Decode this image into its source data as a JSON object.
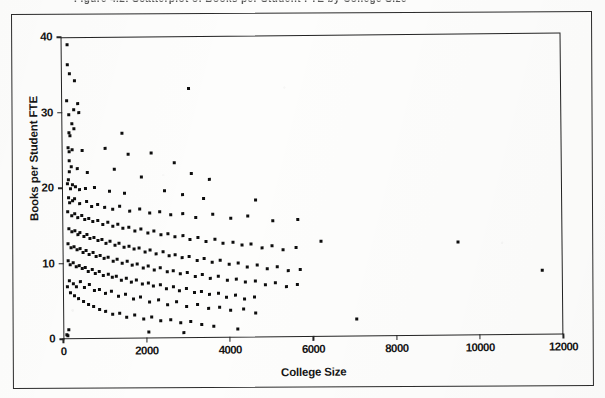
{
  "figure": {
    "caption": "Figure 4.2:  Scatterplot of Books per Student FTE by College Size"
  },
  "chart_data": {
    "type": "scatter",
    "title": "",
    "xlabel": "College Size",
    "ylabel": "Books per Student FTE",
    "xlim": [
      0,
      12000
    ],
    "ylim": [
      0,
      40
    ],
    "xticks": [
      0,
      2000,
      4000,
      6000,
      8000,
      10000,
      12000
    ],
    "yticks": [
      0,
      10,
      20,
      30,
      40
    ],
    "xtick_labels": [
      "0",
      "2000",
      "4000",
      "6000",
      "8000",
      "10000",
      "12000"
    ],
    "ytick_labels": [
      "0",
      "10",
      "20",
      "30",
      "40"
    ],
    "grid": false,
    "legend": null,
    "marker": "square",
    "marker_color": "#0d0d0d",
    "marker_size_px": 3,
    "n_points": 268,
    "points": [
      [
        150,
        36.3
      ],
      [
        210,
        35.1
      ],
      [
        330,
        34.2
      ],
      [
        120,
        31.6
      ],
      [
        390,
        31.2
      ],
      [
        300,
        30.4
      ],
      [
        420,
        30.0
      ],
      [
        180,
        29.7
      ],
      [
        250,
        28.6
      ],
      [
        300,
        27.9
      ],
      [
        170,
        27.3
      ],
      [
        210,
        26.9
      ],
      [
        1450,
        27.2
      ],
      [
        3050,
        33.0
      ],
      [
        160,
        25.4
      ],
      [
        260,
        25.1
      ],
      [
        170,
        24.8
      ],
      [
        480,
        25.0
      ],
      [
        1050,
        25.2
      ],
      [
        1600,
        24.4
      ],
      [
        2150,
        24.6
      ],
      [
        2700,
        23.2
      ],
      [
        170,
        23.6
      ],
      [
        230,
        22.9
      ],
      [
        190,
        22.2
      ],
      [
        380,
        22.6
      ],
      [
        620,
        22.1
      ],
      [
        1250,
        22.4
      ],
      [
        1900,
        21.4
      ],
      [
        3100,
        21.8
      ],
      [
        3550,
        21.0
      ],
      [
        160,
        21.1
      ],
      [
        120,
        20.6
      ],
      [
        260,
        20.4
      ],
      [
        330,
        20.2
      ],
      [
        200,
        20.0
      ],
      [
        420,
        19.8
      ],
      [
        560,
        19.9
      ],
      [
        780,
        20.1
      ],
      [
        1150,
        19.6
      ],
      [
        1500,
        19.3
      ],
      [
        2450,
        19.5
      ],
      [
        2900,
        19.0
      ],
      [
        3400,
        18.5
      ],
      [
        4650,
        18.2
      ],
      [
        150,
        18.8
      ],
      [
        240,
        18.4
      ],
      [
        190,
        18.1
      ],
      [
        310,
        18.6
      ],
      [
        430,
        17.9
      ],
      [
        580,
        18.2
      ],
      [
        700,
        17.6
      ],
      [
        860,
        17.8
      ],
      [
        1020,
        17.4
      ],
      [
        1200,
        17.1
      ],
      [
        1380,
        17.5
      ],
      [
        1620,
        16.9
      ],
      [
        1850,
        17.2
      ],
      [
        2100,
        16.6
      ],
      [
        2350,
        16.8
      ],
      [
        2600,
        16.3
      ],
      [
        2880,
        16.5
      ],
      [
        3200,
        16.0
      ],
      [
        3600,
        16.4
      ],
      [
        4050,
        15.8
      ],
      [
        4450,
        16.1
      ],
      [
        5050,
        15.4
      ],
      [
        5650,
        15.6
      ],
      [
        140,
        16.9
      ],
      [
        230,
        16.4
      ],
      [
        300,
        16.6
      ],
      [
        380,
        16.1
      ],
      [
        460,
        16.3
      ],
      [
        540,
        15.8
      ],
      [
        640,
        16.0
      ],
      [
        740,
        15.5
      ],
      [
        850,
        15.7
      ],
      [
        960,
        15.2
      ],
      [
        1080,
        15.4
      ],
      [
        1200,
        14.9
      ],
      [
        1330,
        15.1
      ],
      [
        1460,
        14.6
      ],
      [
        1600,
        14.8
      ],
      [
        1740,
        14.3
      ],
      [
        1890,
        14.5
      ],
      [
        2040,
        14.0
      ],
      [
        2200,
        14.2
      ],
      [
        2360,
        13.7
      ],
      [
        2530,
        13.9
      ],
      [
        2700,
        13.4
      ],
      [
        2880,
        13.6
      ],
      [
        3060,
        13.1
      ],
      [
        3250,
        13.3
      ],
      [
        3450,
        12.8
      ],
      [
        3650,
        13.0
      ],
      [
        3860,
        12.5
      ],
      [
        4080,
        12.7
      ],
      [
        4300,
        12.2
      ],
      [
        4530,
        12.4
      ],
      [
        4780,
        11.9
      ],
      [
        5030,
        12.1
      ],
      [
        5300,
        11.6
      ],
      [
        5600,
        11.8
      ],
      [
        6200,
        12.6
      ],
      [
        9500,
        12.4
      ],
      [
        150,
        14.7
      ],
      [
        220,
        14.2
      ],
      [
        290,
        14.4
      ],
      [
        360,
        13.9
      ],
      [
        430,
        14.1
      ],
      [
        510,
        13.6
      ],
      [
        590,
        13.8
      ],
      [
        670,
        13.3
      ],
      [
        760,
        13.5
      ],
      [
        850,
        13.0
      ],
      [
        940,
        13.2
      ],
      [
        1040,
        12.7
      ],
      [
        1140,
        12.9
      ],
      [
        1250,
        12.4
      ],
      [
        1360,
        12.6
      ],
      [
        1470,
        12.1
      ],
      [
        1590,
        12.3
      ],
      [
        1710,
        11.8
      ],
      [
        1840,
        12.0
      ],
      [
        1970,
        11.5
      ],
      [
        2110,
        11.7
      ],
      [
        2250,
        11.2
      ],
      [
        2400,
        11.4
      ],
      [
        2550,
        10.9
      ],
      [
        2710,
        11.1
      ],
      [
        2870,
        10.6
      ],
      [
        3040,
        10.8
      ],
      [
        3220,
        10.3
      ],
      [
        3400,
        10.5
      ],
      [
        3590,
        10.0
      ],
      [
        3790,
        10.2
      ],
      [
        4000,
        9.7
      ],
      [
        4210,
        9.9
      ],
      [
        4430,
        9.4
      ],
      [
        4660,
        9.6
      ],
      [
        4900,
        9.1
      ],
      [
        5150,
        9.3
      ],
      [
        5420,
        8.8
      ],
      [
        5700,
        9.0
      ],
      [
        11500,
        8.6
      ],
      [
        140,
        12.6
      ],
      [
        200,
        12.1
      ],
      [
        270,
        12.3
      ],
      [
        340,
        11.8
      ],
      [
        410,
        12.0
      ],
      [
        480,
        11.5
      ],
      [
        560,
        11.7
      ],
      [
        640,
        11.2
      ],
      [
        720,
        11.4
      ],
      [
        810,
        10.9
      ],
      [
        900,
        11.1
      ],
      [
        1000,
        10.6
      ],
      [
        1100,
        10.8
      ],
      [
        1200,
        10.3
      ],
      [
        1310,
        10.5
      ],
      [
        1420,
        10.0
      ],
      [
        1540,
        10.2
      ],
      [
        1660,
        9.7
      ],
      [
        1790,
        9.9
      ],
      [
        1920,
        9.4
      ],
      [
        2060,
        9.6
      ],
      [
        2200,
        9.1
      ],
      [
        2350,
        9.3
      ],
      [
        2500,
        8.8
      ],
      [
        2660,
        9.0
      ],
      [
        2820,
        8.5
      ],
      [
        2990,
        8.7
      ],
      [
        3170,
        8.2
      ],
      [
        3350,
        8.4
      ],
      [
        3540,
        7.9
      ],
      [
        3740,
        8.1
      ],
      [
        3950,
        7.6
      ],
      [
        4160,
        7.8
      ],
      [
        4380,
        7.3
      ],
      [
        4610,
        7.5
      ],
      [
        4850,
        7.0
      ],
      [
        5100,
        7.2
      ],
      [
        5360,
        6.7
      ],
      [
        5630,
        6.9
      ],
      [
        130,
        10.4
      ],
      [
        190,
        9.9
      ],
      [
        250,
        10.1
      ],
      [
        320,
        9.6
      ],
      [
        390,
        9.8
      ],
      [
        460,
        9.3
      ],
      [
        540,
        9.5
      ],
      [
        620,
        9.0
      ],
      [
        700,
        9.2
      ],
      [
        790,
        8.7
      ],
      [
        880,
        8.9
      ],
      [
        980,
        8.4
      ],
      [
        1080,
        8.6
      ],
      [
        1180,
        8.1
      ],
      [
        1290,
        8.3
      ],
      [
        1400,
        7.8
      ],
      [
        1520,
        8.0
      ],
      [
        1640,
        7.5
      ],
      [
        1770,
        7.7
      ],
      [
        1900,
        7.2
      ],
      [
        2040,
        7.4
      ],
      [
        2180,
        6.9
      ],
      [
        2330,
        7.1
      ],
      [
        2480,
        6.6
      ],
      [
        2640,
        6.8
      ],
      [
        2800,
        6.3
      ],
      [
        2970,
        6.5
      ],
      [
        3150,
        6.0
      ],
      [
        3330,
        6.2
      ],
      [
        3520,
        5.7
      ],
      [
        3720,
        5.9
      ],
      [
        3930,
        5.4
      ],
      [
        4140,
        5.6
      ],
      [
        4360,
        5.1
      ],
      [
        4590,
        5.3
      ],
      [
        160,
        7.8
      ],
      [
        240,
        7.4
      ],
      [
        330,
        7.0
      ],
      [
        420,
        7.6
      ],
      [
        520,
        6.8
      ],
      [
        630,
        7.2
      ],
      [
        750,
        6.4
      ],
      [
        880,
        6.6
      ],
      [
        1020,
        6.0
      ],
      [
        1170,
        6.3
      ],
      [
        1330,
        5.6
      ],
      [
        1500,
        5.9
      ],
      [
        1680,
        5.2
      ],
      [
        1870,
        5.5
      ],
      [
        2070,
        4.9
      ],
      [
        2280,
        5.1
      ],
      [
        2500,
        4.5
      ],
      [
        2730,
        4.8
      ],
      [
        2970,
        4.2
      ],
      [
        3220,
        4.4
      ],
      [
        3480,
        3.9
      ],
      [
        3750,
        4.1
      ],
      [
        4030,
        3.6
      ],
      [
        4320,
        3.8
      ],
      [
        4620,
        3.3
      ],
      [
        110,
        6.9
      ],
      [
        180,
        6.2
      ],
      [
        270,
        5.8
      ],
      [
        370,
        5.4
      ],
      [
        480,
        5.0
      ],
      [
        600,
        4.6
      ],
      [
        730,
        4.3
      ],
      [
        870,
        3.9
      ],
      [
        1020,
        3.6
      ],
      [
        1180,
        3.2
      ],
      [
        1350,
        3.4
      ],
      [
        1530,
        2.9
      ],
      [
        1720,
        3.1
      ],
      [
        1920,
        2.6
      ],
      [
        2130,
        2.8
      ],
      [
        2350,
        2.3
      ],
      [
        2580,
        2.5
      ],
      [
        2820,
        2.0
      ],
      [
        3070,
        2.2
      ],
      [
        3330,
        1.8
      ],
      [
        3600,
        1.5
      ],
      [
        7050,
        2.3
      ],
      [
        120,
        1.2
      ],
      [
        90,
        0.6
      ],
      [
        2050,
        0.9
      ],
      [
        2900,
        0.7
      ],
      [
        4180,
        1.1
      ],
      [
        150,
        39.0
      ],
      [
        100,
        0.4
      ]
    ]
  }
}
